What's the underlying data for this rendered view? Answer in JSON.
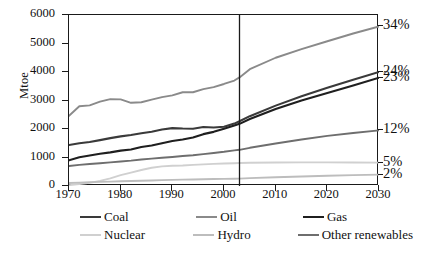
{
  "chart_data": {
    "type": "line",
    "title": "",
    "xlabel": "",
    "ylabel": "Mtoe",
    "xlim": [
      1970,
      2030
    ],
    "ylim": [
      0,
      6000
    ],
    "grid": false,
    "legend_position": "bottom",
    "x_ticks": [
      "1970",
      "1980",
      "1990",
      "2000",
      "2010",
      "2020",
      "2030"
    ],
    "y_ticks": [
      "0",
      "1000",
      "2000",
      "3000",
      "4000",
      "5000",
      "6000"
    ],
    "right_axis_labels": [
      {
        "label": "34%",
        "series": "Oil",
        "value": 5600
      },
      {
        "label": "24%",
        "series": "Coal",
        "value": 4000
      },
      {
        "label": "23%",
        "series": "Gas",
        "value": 3800
      },
      {
        "label": "12%",
        "series": "Other renewables",
        "value": 1950
      },
      {
        "label": "5%",
        "series": "Nuclear",
        "value": 820
      },
      {
        "label": "2%",
        "series": "Hydro",
        "value": 400
      }
    ],
    "annotations": [
      {
        "type": "vline",
        "x": 2003,
        "label": "history / projection divider"
      }
    ],
    "x": [
      1970,
      1972,
      1974,
      1976,
      1978,
      1980,
      1982,
      1984,
      1986,
      1988,
      1990,
      1992,
      1994,
      1996,
      1998,
      2000,
      2002,
      2003,
      2005,
      2010,
      2015,
      2020,
      2025,
      2030
    ],
    "series": [
      {
        "name": "Coal",
        "color": "#3a3a3a",
        "values": [
          1440,
          1500,
          1545,
          1610,
          1680,
          1740,
          1790,
          1850,
          1905,
          1980,
          2030,
          2015,
          2010,
          2070,
          2050,
          2080,
          2190,
          2270,
          2450,
          2820,
          3150,
          3450,
          3730,
          4000
        ]
      },
      {
        "name": "Oil",
        "color": "#8a8a8a",
        "values": [
          2460,
          2800,
          2830,
          2960,
          3050,
          3040,
          2920,
          2940,
          3030,
          3120,
          3180,
          3290,
          3290,
          3400,
          3470,
          3580,
          3700,
          3810,
          4100,
          4500,
          4800,
          5080,
          5350,
          5600
        ]
      },
      {
        "name": "Gas",
        "color": "#1f1f1f",
        "values": [
          900,
          1010,
          1070,
          1130,
          1180,
          1240,
          1280,
          1370,
          1420,
          1500,
          1580,
          1630,
          1700,
          1820,
          1900,
          2010,
          2120,
          2180,
          2350,
          2700,
          3000,
          3260,
          3530,
          3800
        ]
      },
      {
        "name": "Nuclear",
        "color": "#d0d0d0",
        "values": [
          30,
          70,
          110,
          180,
          270,
          380,
          470,
          560,
          640,
          690,
          710,
          720,
          740,
          760,
          775,
          790,
          800,
          805,
          815,
          825,
          830,
          830,
          825,
          820
        ]
      },
      {
        "name": "Hydro",
        "color": "#bdbdbd",
        "values": [
          105,
          120,
          135,
          145,
          155,
          165,
          175,
          185,
          195,
          205,
          215,
          222,
          228,
          235,
          243,
          250,
          256,
          260,
          275,
          305,
          335,
          360,
          382,
          400
        ]
      },
      {
        "name": "Other renewables",
        "color": "#6e6e6e",
        "values": [
          700,
          740,
          770,
          800,
          830,
          860,
          890,
          930,
          960,
          990,
          1020,
          1050,
          1080,
          1120,
          1160,
          1200,
          1250,
          1270,
          1340,
          1490,
          1630,
          1760,
          1860,
          1950
        ]
      }
    ]
  },
  "axis": {
    "y_title": "Mtoe"
  },
  "legend": {
    "rows": [
      [
        {
          "label": "Coal",
          "color": "#3a3a3a",
          "width": "2.2px"
        },
        {
          "label": "Oil",
          "color": "#8a8a8a",
          "width": "2.2px"
        },
        {
          "label": "Gas",
          "color": "#1f1f1f",
          "width": "2.4px"
        }
      ],
      [
        {
          "label": "Nuclear",
          "color": "#d0d0d0",
          "width": "2.2px"
        },
        {
          "label": "Hydro",
          "color": "#bdbdbd",
          "width": "2.2px"
        },
        {
          "label": "Other renewables",
          "color": "#6e6e6e",
          "width": "2.4px"
        }
      ]
    ]
  }
}
